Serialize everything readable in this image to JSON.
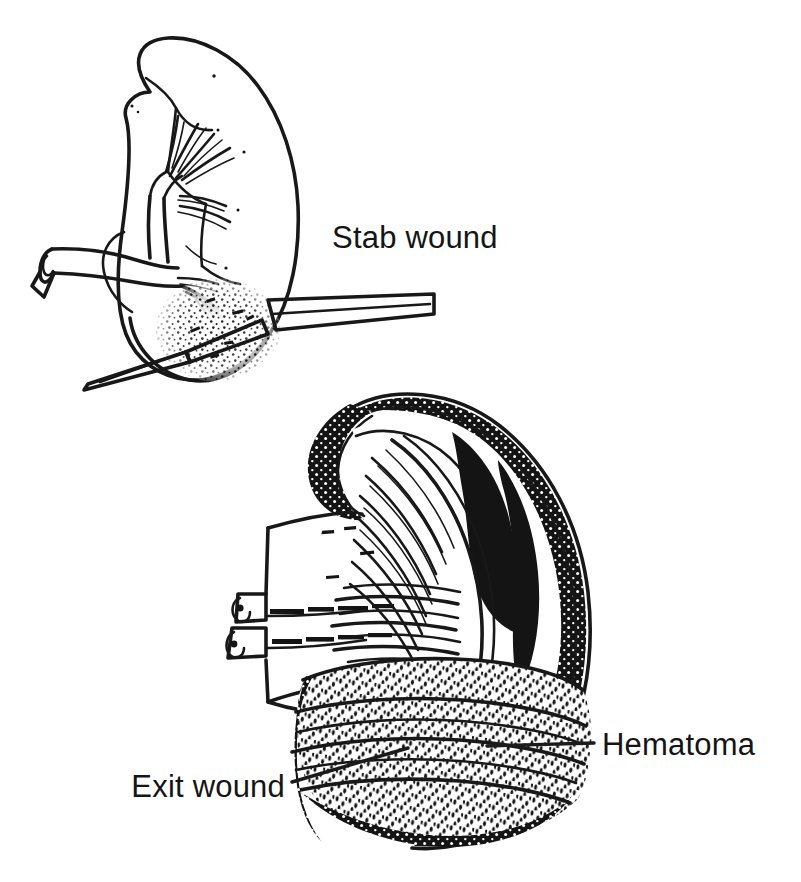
{
  "figure": {
    "kind": "medical-illustration",
    "background_color": "#ffffff",
    "ink_color": "#151515",
    "panels": [
      {
        "id": "upper-panel",
        "name": "stab-wound-kidney",
        "description": "Line-drawing of a kidney in outline view with renal vessels entering the hilum; a knife blade transfixes the lower pole, and a stippled zone marks parenchymal hemorrhage around the blade tract.",
        "labels": [
          "Stab wound"
        ]
      },
      {
        "id": "lower-panel",
        "name": "exit-wound-kidney",
        "description": "Heavily shaded cutaway of a kidney showing cortex, medullary pyramids and radiating tubules, cut renal artery and vein stumps, and a large stippled subcapsular hematoma over the lower pole with a bullet exit wound.",
        "labels": [
          "Exit wound",
          "Hematoma"
        ]
      }
    ]
  },
  "annotations": [
    {
      "id": "stab-wound",
      "text": "Stab wound",
      "x": 332,
      "y": 248,
      "align": "start",
      "has_leader": false
    },
    {
      "id": "exit-wound",
      "text": "Exit wound",
      "x": 285,
      "y": 797,
      "align": "end",
      "has_leader": true
    },
    {
      "id": "hematoma",
      "text": "Hematoma",
      "x": 602,
      "y": 755,
      "align": "start",
      "has_leader": true
    }
  ]
}
